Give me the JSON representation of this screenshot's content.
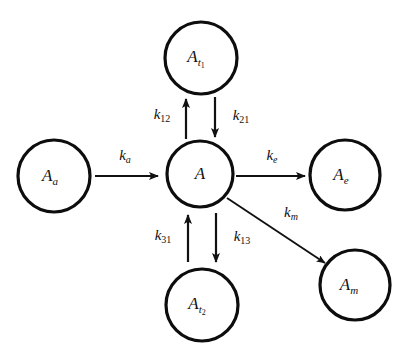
{
  "diagram": {
    "type": "compartmental-kinetic-model",
    "background_color": "#ffffff",
    "stroke_color": "#111111",
    "nodes": [
      {
        "id": "A_a",
        "base": "A",
        "sub": "a",
        "subsub": "",
        "cx": 54,
        "cy": 176,
        "r": 36
      },
      {
        "id": "A",
        "base": "A",
        "sub": "",
        "subsub": "",
        "cx": 200,
        "cy": 174,
        "r": 33
      },
      {
        "id": "A_t1",
        "base": "A",
        "sub": "t",
        "subsub": "1",
        "cx": 201,
        "cy": 58,
        "r": 36
      },
      {
        "id": "A_t2",
        "base": "A",
        "sub": "t",
        "subsub": "2",
        "cx": 202,
        "cy": 305,
        "r": 36
      },
      {
        "id": "A_e",
        "base": "A",
        "sub": "e",
        "subsub": "",
        "cx": 345,
        "cy": 175,
        "r": 35
      },
      {
        "id": "A_m",
        "base": "A",
        "sub": "m",
        "subsub": "",
        "cx": 355,
        "cy": 285,
        "r": 35
      }
    ],
    "edges": [
      {
        "id": "k_a",
        "from": "A_a",
        "to": "A",
        "base": "k",
        "sub": "a",
        "sub_style": "italic",
        "label_x": 125,
        "label_y": 157
      },
      {
        "id": "k_e",
        "from": "A",
        "to": "A_e",
        "base": "k",
        "sub": "e",
        "sub_style": "italic",
        "label_x": 272,
        "label_y": 157
      },
      {
        "id": "k_m",
        "from": "A",
        "to": "A_m",
        "base": "k",
        "sub": "m",
        "sub_style": "italic",
        "label_x": 291,
        "label_y": 214
      },
      {
        "id": "k_12",
        "from": "A",
        "to": "A_t1",
        "base": "k",
        "sub": "12",
        "sub_style": "number",
        "label_x": 162,
        "label_y": 116
      },
      {
        "id": "k_21",
        "from": "A_t1",
        "to": "A",
        "base": "k",
        "sub": "21",
        "sub_style": "number",
        "label_x": 241,
        "label_y": 117
      },
      {
        "id": "k_31",
        "from": "A_t2",
        "to": "A",
        "base": "k",
        "sub": "31",
        "sub_style": "number",
        "label_x": 163,
        "label_y": 237
      },
      {
        "id": "k_13",
        "from": "A",
        "to": "A_t2",
        "base": "k",
        "sub": "13",
        "sub_style": "number",
        "label_x": 242,
        "label_y": 238
      }
    ]
  }
}
